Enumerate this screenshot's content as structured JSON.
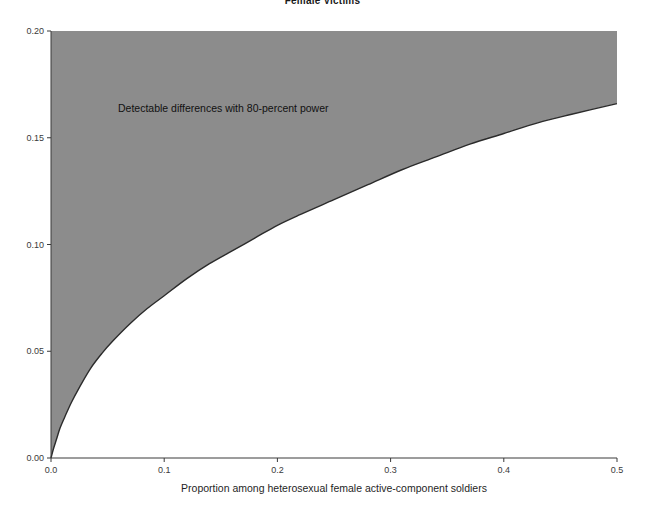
{
  "figure": {
    "title": "Female Victims",
    "background_color": "#ffffff"
  },
  "annotation": {
    "text": "Detectable differences with 80-percent power"
  },
  "axes": {
    "x_label": "Proportion among heterosexual female active-component soldiers",
    "y_label": "",
    "x_ticks": [
      "0.0",
      "0.1",
      "0.2",
      "0.3",
      "0.4",
      "0.5"
    ],
    "y_ticks": [
      "0.00",
      "0.05",
      "0.10",
      "0.15",
      "0.20"
    ]
  },
  "chart_data": {
    "type": "area",
    "title": "Female Victims",
    "xlabel": "Proportion among heterosexual female active-component soldiers",
    "ylabel": "",
    "xlim": [
      0.0,
      0.5
    ],
    "ylim": [
      0.0,
      0.2
    ],
    "xticks": [
      0.0,
      0.1,
      0.2,
      0.3,
      0.4,
      0.5
    ],
    "yticks": [
      0.0,
      0.05,
      0.1,
      0.15,
      0.2
    ],
    "grid": false,
    "legend": null,
    "annotations": [
      {
        "text": "Detectable differences with 80-percent power",
        "x": 0.06,
        "y": 0.168
      }
    ],
    "series": [
      {
        "name": "Minimum detectable difference (80% power)",
        "fill_above": true,
        "fill_color": "#8c8c8c",
        "line_color": "#2b2b2b",
        "x": [
          0.0,
          0.002,
          0.005,
          0.008,
          0.012,
          0.018,
          0.025,
          0.035,
          0.045,
          0.055,
          0.07,
          0.085,
          0.1,
          0.12,
          0.14,
          0.16,
          0.18,
          0.2,
          0.22,
          0.25,
          0.28,
          0.31,
          0.34,
          0.37,
          0.4,
          0.43,
          0.46,
          0.5
        ],
        "y": [
          0.0,
          0.004,
          0.009,
          0.014,
          0.019,
          0.026,
          0.033,
          0.042,
          0.049,
          0.055,
          0.063,
          0.07,
          0.076,
          0.084,
          0.091,
          0.097,
          0.103,
          0.109,
          0.114,
          0.121,
          0.128,
          0.135,
          0.141,
          0.147,
          0.152,
          0.157,
          0.161,
          0.166
        ]
      }
    ],
    "region_description": "Shaded region above the curve marks effect sizes detectable with 80-percent power"
  }
}
